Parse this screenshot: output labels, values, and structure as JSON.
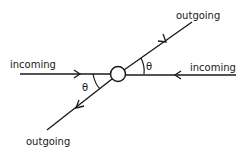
{
  "diagram": {
    "type": "scattering-vertex",
    "labels": {
      "incoming_left": "incoming",
      "incoming_right": "incoming",
      "outgoing_top": "outgoing",
      "outgoing_bottom": "outgoing",
      "angle_left": "θ",
      "angle_right": "θ"
    },
    "colors": {
      "stroke": "#1a1a1a",
      "background": "#ffffff"
    }
  }
}
